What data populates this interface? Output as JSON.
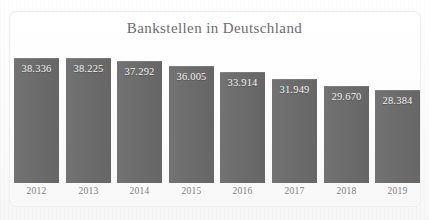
{
  "chart_data": {
    "type": "bar",
    "title": "Bankstellen in Deutschland",
    "xlabel": "",
    "ylabel": "",
    "categories": [
      "2012",
      "2013",
      "2014",
      "2015",
      "2016",
      "2017",
      "2018",
      "2019"
    ],
    "values": [
      38336,
      38225,
      37292,
      36005,
      33914,
      31949,
      29670,
      28384
    ],
    "value_labels": [
      "38.336",
      "38.225",
      "37.292",
      "36.005",
      "33.914",
      "31.949",
      "29.670",
      "28.384"
    ],
    "ylim": [
      0,
      42000
    ],
    "grid": false,
    "legend": false,
    "bar_color": "#6d6d6d",
    "label_color": "#f4f4f4",
    "title_color": "#6c6c6c",
    "tick_color": "#7e7e7e",
    "background_color": "#fcfcfc",
    "frame_color": "#efefef",
    "number_format": "de-DE thousands separator '.'"
  }
}
